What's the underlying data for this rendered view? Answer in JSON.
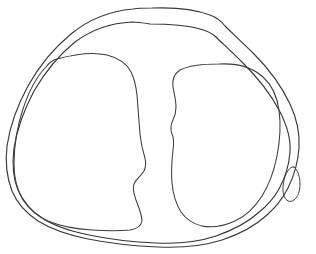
{
  "figure": {
    "title": "Anatomical cross-section line drawing",
    "canvas": {
      "width": 316,
      "height": 254,
      "background_color": "#ffffff"
    },
    "style": {
      "stroke_color": "#2b2b2b",
      "stroke_width": 1.15,
      "fill": "none"
    },
    "shapes": [
      {
        "id": "outer-capsule-contour",
        "name": "outer-capsule-contour",
        "label": "Outer capsule contour",
        "stroke_color": "#3a3a3a",
        "stroke_width": 1.15,
        "closed": true,
        "bounds": {
          "x": 6,
          "y": 7,
          "width": 296,
          "height": 241
        },
        "path": "M 152 8 C 178 7 197 10 210 15 C 218 18 222 22 225 26 C 232 33 242 42 254 54 C 268 68 281 85 290 104 C 297 119 300 134 299 148 C 298 163 294 176 288 188 C 283 198 276 207 267 215 C 255 226 240 234 222 240 C 203 246 181 248 158 247 C 132 246 108 243 88 239 C 68 235 51 229 38 221 C 26 213 17 203 12 191 C 7 178 5 163 7 146 C 10 126 17 106 28 86 C 39 66 54 48 71 34 C 88 20 110 11 133 9 C 139 8 146 8 152 8 Z"
      },
      {
        "id": "inner-contour",
        "name": "inner-contour",
        "label": "Inner contour following the capsule",
        "stroke_color": "#333333",
        "stroke_width": 1.1,
        "closed": true,
        "bounds": {
          "x": 12,
          "y": 22,
          "width": 283,
          "height": 222
        },
        "path": "M 150 24 C 172 24 189 26 200 29 C 208 31 213 34 216 37 C 222 43 231 51 243 63 C 257 77 270 93 279 110 C 287 125 291 139 290 152 C 289 166 285 178 279 189 C 274 198 267 206 258 213 C 247 223 233 230 216 236 C 198 242 177 244 156 243 C 131 242 108 239 89 235 C 70 231 54 226 42 218 C 31 211 23 201 18 190 C 13 178 12 164 14 148 C 17 129 24 110 34 91 C 45 72 59 55 75 42 C 91 30 111 23 132 22 C 138 22 144 23 150 24 Z"
      },
      {
        "id": "left-compartment-blob",
        "name": "left-compartment-blob",
        "label": "Left compartment (medial condyle outline)",
        "stroke_color": "#3c3c3c",
        "stroke_width": 1.05,
        "closed": true,
        "bounds": {
          "x": 14,
          "y": 53,
          "width": 134,
          "height": 177
        },
        "path": "M 57 59 C 75 54 94 52 107 55 C 119 58 127 64 131 72 C 134 78 136 86 137 95 C 138 108 139 122 140 134 C 141 145 143 152 145 158 C 146 163 146 167 144 171 C 141 176 136 179 134 184 C 132 189 134 194 136 200 C 139 208 142 215 142 221 C 141 226 137 229 130 230 C 120 231 106 231 92 230 C 75 229 60 226 48 221 C 37 216 29 209 23 200 C 17 190 14 178 14 164 C 14 146 17 127 23 109 C 29 91 37 76 46 67 C 49 63 53 60 57 59 Z"
      },
      {
        "id": "right-compartment-blob",
        "name": "right-compartment-blob",
        "label": "Right compartment (lateral condyle outline)",
        "stroke_color": "#3c3c3c",
        "stroke_width": 1.05,
        "closed": true,
        "bounds": {
          "x": 170,
          "y": 62,
          "width": 110,
          "height": 166
        },
        "path": "M 219 64 C 238 63 253 68 263 77 C 272 85 277 96 279 110 C 281 125 280 141 277 156 C 274 171 269 185 262 196 C 255 207 246 216 235 221 C 224 226 212 228 202 226 C 193 224 186 219 181 212 C 176 204 173 194 172 183 C 171 171 172 159 173 150 C 174 143 174 138 172 134 C 170 129 171 124 173 120 C 175 116 176 112 176 107 C 176 100 174 93 173 87 C 172 80 174 74 180 70 C 190 65 205 64 219 64 Z"
      },
      {
        "id": "marginal-oval-structure",
        "name": "marginal-oval-structure",
        "label": "Small elongated oval structure at right margin",
        "stroke_color": "#3f3f3f",
        "stroke_width": 1.0,
        "closed": true,
        "bounds": {
          "x": 283,
          "y": 166,
          "width": 18,
          "height": 36
        },
        "path": "M 294 167 C 298 170 300 177 300 184 C 300 191 298 197 294 200 C 290 203 286 201 284 196 C 282 190 283 181 286 174 C 288 170 291 166 294 167 Z"
      }
    ]
  }
}
